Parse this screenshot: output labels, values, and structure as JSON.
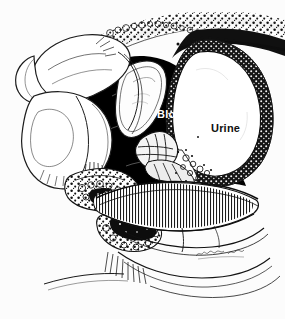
{
  "figure": {
    "kind": "medical-illustration",
    "view": "sagittal cross-section of male pelvis",
    "background_color": "#fcfcfc",
    "ink_color": "#101010",
    "width": 285,
    "height": 319,
    "labels": [
      {
        "id": "blood",
        "text": "Blood",
        "color": "#ffffff",
        "on_fill": "#000000",
        "x": 157,
        "y": 109
      },
      {
        "id": "urine",
        "text": "Urine",
        "color": "#101010",
        "on_fill": "#ffffff",
        "x": 211,
        "y": 123
      }
    ],
    "regions": [
      {
        "id": "blood-collection",
        "label": "Blood",
        "fill": "#000000",
        "description": "large solid black extravasated blood collection filling the retropubic / prevesical space"
      },
      {
        "id": "bladder-lumen",
        "label": "Urine",
        "fill": "#ffffff",
        "description": "urine-filled urinary bladder lumen, rounded, outlined by thick speckled dark wall"
      },
      {
        "id": "bladder-wall",
        "label": "",
        "fill": "#151515",
        "description": "thick stippled detrusor muscle wall ringing the bladder"
      },
      {
        "id": "penis",
        "label": "",
        "fill": "#ffffff",
        "description": "penis shown in sagittal section at upper left, outlined in fine ink line"
      },
      {
        "id": "scrotum",
        "label": "",
        "fill": "#ffffff",
        "description": "scrotum and testis below and left of the penis"
      },
      {
        "id": "abdominal-wall",
        "label": "",
        "fill": "#222222",
        "description": "anterior abdominal wall sweeping across the top with stippled subcutaneous fat"
      },
      {
        "id": "prostate-seminal-vesicle",
        "label": "",
        "fill": "#ffffff",
        "description": "prostate and seminal vesicle cluster at the bladder base, stippled lobes on black background"
      },
      {
        "id": "pelvic-floor",
        "label": "",
        "fill": "#ffffff",
        "description": "striated levator ani / pelvic floor musculature drawn as a dense band of vertical hatching across the lower third"
      },
      {
        "id": "perineum",
        "label": "",
        "fill": "#ffffff",
        "description": "perineal soft tissue and ischiorectal fat with stippled fat lobules at lower left"
      }
    ],
    "signature": {
      "present": true,
      "text": "",
      "x": 206,
      "y": 253,
      "description": "small illegible handwritten artist signature near the lower right of the drawing"
    }
  }
}
